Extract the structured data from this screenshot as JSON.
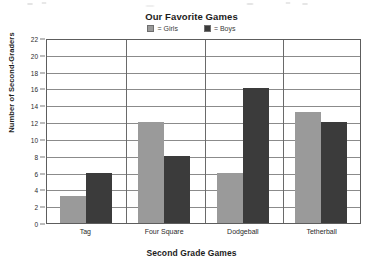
{
  "chart_data": {
    "type": "bar",
    "title": "Our Favorite Games",
    "xlabel": "Second Grade Games",
    "ylabel": "Number of Second-Graders",
    "categories": [
      "Tag",
      "Four Square",
      "Dodgeball",
      "Tetherball"
    ],
    "series": [
      {
        "name": "Girls",
        "color": "#9a9a9a",
        "values": [
          3.2,
          12,
          6,
          13.2
        ]
      },
      {
        "name": "Boys",
        "color": "#3b3b3b",
        "values": [
          6,
          8,
          16,
          12
        ]
      }
    ],
    "ylim": [
      0,
      22
    ],
    "ytick_step": 2,
    "yticks": [
      0,
      2,
      4,
      6,
      8,
      10,
      12,
      14,
      16,
      18,
      20,
      22
    ],
    "ytick_labels": [
      "0",
      "2",
      "4",
      "6",
      "8",
      "10",
      "12",
      "14",
      "16",
      "18",
      "20",
      "22"
    ],
    "grid": true,
    "grid_axis": "y",
    "legend_position": "top-center",
    "legend_entries": [
      {
        "label": "= Girls",
        "color": "#9a9a9a"
      },
      {
        "label": "= Boys",
        "color": "#3b3b3b"
      }
    ]
  }
}
